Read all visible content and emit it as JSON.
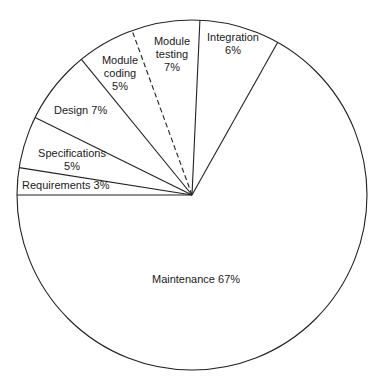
{
  "chart_data": {
    "type": "pie",
    "title": "",
    "center": [
      192,
      195
    ],
    "radius": 175,
    "start_angle_deg": 180,
    "direction": "clockwise",
    "slices": [
      {
        "name": "Requirements",
        "value": 3,
        "label_lines": [
          "Requirements   3%"
        ],
        "label_pos": [
          22,
          189
        ],
        "anchor": "start",
        "boundary_end_deg": 171
      },
      {
        "name": "Specifications",
        "value": 5,
        "label_lines": [
          "Specifications",
          "5%"
        ],
        "label_pos": [
          72,
          157
        ],
        "anchor": "middle",
        "boundary_end_deg": 153.7
      },
      {
        "name": "Design",
        "value": 7,
        "label_lines": [
          "Design   7%"
        ],
        "label_pos": [
          54,
          114
        ],
        "anchor": "start",
        "boundary_end_deg": 129.2
      },
      {
        "name": "Module coding",
        "value": 5,
        "label_lines": [
          "Module",
          "coding",
          "5%"
        ],
        "label_pos": [
          120,
          64
        ],
        "anchor": "middle",
        "boundary_end_deg": 110,
        "boundary_dashed": true
      },
      {
        "name": "Module testing",
        "value": 7,
        "label_lines": [
          "Module",
          "testing",
          "7%"
        ],
        "label_pos": [
          172,
          45
        ],
        "anchor": "middle",
        "boundary_end_deg": 87.4
      },
      {
        "name": "Integration",
        "value": 6,
        "label_lines": [
          "Integration",
          "6%"
        ],
        "label_pos": [
          233,
          41
        ],
        "anchor": "middle",
        "boundary_end_deg": 60.7
      },
      {
        "name": "Maintenance",
        "value": 67,
        "label_lines": [
          "Maintenance   67%"
        ],
        "label_pos": [
          196,
          283
        ],
        "anchor": "middle",
        "boundary_end_deg": 180
      }
    ],
    "colors": {
      "stroke": "#222222",
      "fill": "#ffffff",
      "text": "#1a1a1a"
    }
  }
}
